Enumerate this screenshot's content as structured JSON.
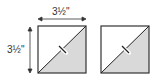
{
  "diagram": {
    "width_label": "3½\"",
    "height_label": "3½\"",
    "squares": [
      {
        "name": "half-square-triangle-marked",
        "fill_lower": "#d9d9d9",
        "fill_upper": "#ffffff"
      },
      {
        "name": "half-square-triangle-plain",
        "fill_lower": "#d9d9d9",
        "fill_upper": "#ffffff"
      }
    ]
  }
}
